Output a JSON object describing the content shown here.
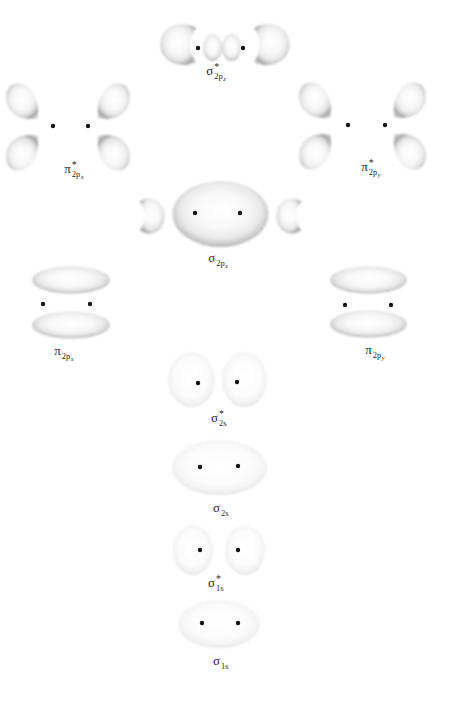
{
  "figure": {
    "background_color": "#ffffff",
    "lobe_rim_color": "#9b9b9b",
    "lobe_fill_color": "#f6f6f6",
    "nucleus_dot_color": "#151515",
    "label_color": "#2a2a2a"
  },
  "orbitals": [
    {
      "id": "sigma-star-2pz",
      "symbol": "σ",
      "star": "*",
      "sub": "2p",
      "axis": "z"
    },
    {
      "id": "pi-star-2px",
      "symbol": "π",
      "star": "*",
      "sub": "2p",
      "axis": "x"
    },
    {
      "id": "pi-star-2py",
      "symbol": "π",
      "star": "*",
      "sub": "2p",
      "axis": "y"
    },
    {
      "id": "sigma-2pz",
      "symbol": "σ",
      "star": "",
      "sub": "2p",
      "axis": "z"
    },
    {
      "id": "pi-2px",
      "symbol": "π",
      "star": "",
      "sub": "2p",
      "axis": "x"
    },
    {
      "id": "pi-2py",
      "symbol": "π",
      "star": "",
      "sub": "2p",
      "axis": "y"
    },
    {
      "id": "sigma-star-2s",
      "symbol": "σ",
      "star": "*",
      "sub": "2s",
      "axis": ""
    },
    {
      "id": "sigma-2s",
      "symbol": "σ",
      "star": "",
      "sub": "2s",
      "axis": ""
    },
    {
      "id": "sigma-star-1s",
      "symbol": "σ",
      "star": "*",
      "sub": "1s",
      "axis": ""
    },
    {
      "id": "sigma-1s",
      "symbol": "σ",
      "star": "",
      "sub": "1s",
      "axis": ""
    }
  ]
}
